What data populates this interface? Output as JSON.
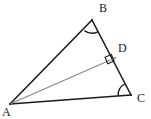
{
  "figure": {
    "background_color": "#ffffff",
    "width": 151,
    "height": 119,
    "stroke_color": "#1c1c1c",
    "cevian_color": "#8a8a8a",
    "label_color": "#1c1c1c"
  },
  "points": {
    "A": {
      "label": "A",
      "x": 10,
      "y": 104,
      "label_x": 2,
      "label_y": 106
    },
    "B": {
      "label": "B",
      "x": 92,
      "y": 20,
      "label_x": 99,
      "label_y": 2
    },
    "C": {
      "label": "C",
      "x": 131,
      "y": 95,
      "label_x": 137,
      "label_y": 92
    },
    "D": {
      "label": "D",
      "x": 115,
      "y": 58,
      "label_x": 118,
      "label_y": 42
    }
  },
  "segments": [
    {
      "name": "side-AB",
      "from": "A",
      "to": "B",
      "color": "#1c1c1c",
      "width": 1.6
    },
    {
      "name": "side-BC",
      "from": "B",
      "to": "C",
      "color": "#1c1c1c",
      "width": 1.6
    },
    {
      "name": "side-CA",
      "from": "C",
      "to": "A",
      "color": "#1c1c1c",
      "width": 1.6
    },
    {
      "name": "cevian-AD",
      "from": "A",
      "to": "D",
      "color": "#8a8a8a",
      "width": 1.3
    }
  ],
  "angle_marks": [
    {
      "name": "angle-arc-B",
      "vertex": "B",
      "type": "arc",
      "radius": 13
    },
    {
      "name": "angle-arc-C",
      "vertex": "C",
      "type": "arc",
      "radius": 13
    },
    {
      "name": "right-angle-D",
      "vertex": "D",
      "type": "right-angle-square",
      "size": 7
    }
  ]
}
